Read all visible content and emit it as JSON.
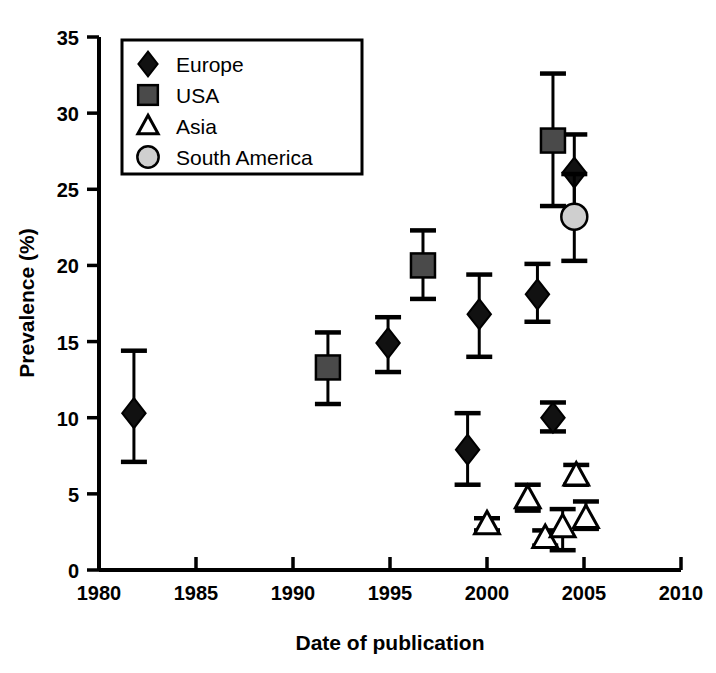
{
  "chart_data": {
    "type": "scatter",
    "title": "",
    "subtitle": "",
    "xlabel": "Date of publication",
    "ylabel": "Prevalence (%)",
    "xlim": [
      1980,
      2010
    ],
    "ylim": [
      0,
      35
    ],
    "xticks": [
      1980,
      1985,
      1990,
      1995,
      2000,
      2005,
      2010
    ],
    "yticks": [
      0,
      5,
      10,
      15,
      20,
      25,
      30,
      35
    ],
    "grid": false,
    "legend_position": "top-left",
    "error_bars": "vertical",
    "series": [
      {
        "name": "Europe",
        "marker": "diamond",
        "color": "#111111",
        "edge_color": "#000000",
        "points": [
          {
            "x": 1981.8,
            "y": 10.3,
            "low": 7.1,
            "high": 14.4
          },
          {
            "x": 1994.9,
            "y": 14.9,
            "low": 13.0,
            "high": 16.6
          },
          {
            "x": 1999.0,
            "y": 7.9,
            "low": 5.6,
            "high": 10.3
          },
          {
            "x": 1999.6,
            "y": 16.8,
            "low": 14.0,
            "high": 19.4
          },
          {
            "x": 2002.6,
            "y": 18.1,
            "low": 16.3,
            "high": 20.1
          },
          {
            "x": 2003.4,
            "y": 10.0,
            "low": 9.1,
            "high": 11.0
          },
          {
            "x": 2004.5,
            "y": 26.1,
            "low": 23.4,
            "high": 28.6
          }
        ]
      },
      {
        "name": "USA",
        "marker": "square",
        "color": "#4a4a4a",
        "edge_color": "#000000",
        "points": [
          {
            "x": 1991.8,
            "y": 13.3,
            "low": 10.9,
            "high": 15.6
          },
          {
            "x": 1996.7,
            "y": 20.0,
            "low": 17.8,
            "high": 22.3
          },
          {
            "x": 2003.4,
            "y": 28.2,
            "low": 23.9,
            "high": 32.6
          }
        ]
      },
      {
        "name": "Asia",
        "marker": "triangle",
        "color": "#ffffff",
        "edge_color": "#000000",
        "points": [
          {
            "x": 2000.0,
            "y": 3.0,
            "low": 2.6,
            "high": 3.4
          },
          {
            "x": 2002.1,
            "y": 4.7,
            "low": 3.9,
            "high": 5.6
          },
          {
            "x": 2003.0,
            "y": 2.1,
            "low": 1.6,
            "high": 2.6
          },
          {
            "x": 2003.9,
            "y": 2.8,
            "low": 1.3,
            "high": 4.0
          },
          {
            "x": 2004.6,
            "y": 6.2,
            "low": 5.6,
            "high": 6.9
          },
          {
            "x": 2005.1,
            "y": 3.4,
            "low": 2.7,
            "high": 4.5
          }
        ]
      },
      {
        "name": "South America",
        "marker": "circle",
        "color": "#cfcfcf",
        "edge_color": "#000000",
        "points": [
          {
            "x": 2004.5,
            "y": 23.2,
            "low": 20.3,
            "high": 26.0
          }
        ]
      }
    ],
    "legend": [
      {
        "label": "Europe",
        "marker": "diamond",
        "color": "#111111"
      },
      {
        "label": "USA",
        "marker": "square",
        "color": "#4a4a4a"
      },
      {
        "label": "Asia",
        "marker": "triangle",
        "color": "#ffffff"
      },
      {
        "label": "South America",
        "marker": "circle",
        "color": "#cfcfcf"
      }
    ]
  }
}
